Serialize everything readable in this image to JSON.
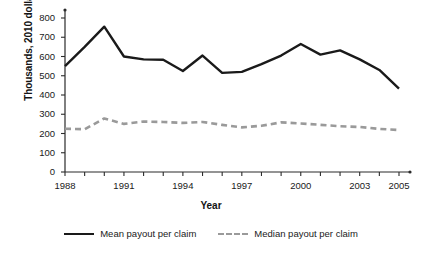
{
  "chart_data": {
    "type": "line",
    "title": "",
    "xlabel": "Year",
    "ylabel": "Thousands, 2010 dollars",
    "xlim": [
      1988,
      2005.4
    ],
    "ylim": [
      0,
      840
    ],
    "grid": false,
    "legend_position": "bottom",
    "x": [
      1988,
      1989,
      1990,
      1991,
      1992,
      1993,
      1994,
      1995,
      1996,
      1997,
      1998,
      1999,
      2000,
      2001,
      2002,
      2003,
      2004,
      2005
    ],
    "xticks": [
      1988,
      1991,
      1994,
      1997,
      2000,
      2003,
      2005
    ],
    "xtick_labels": [
      "1988",
      "1991",
      "1994",
      "1997",
      "2000",
      "2003",
      "2005"
    ],
    "yticks": [
      0,
      100,
      200,
      300,
      400,
      500,
      600,
      700,
      800
    ],
    "ytick_labels": [
      "0",
      "100",
      "200",
      "300",
      "400",
      "500",
      "600",
      "700",
      "800"
    ],
    "series": [
      {
        "name": "Mean payout per claim",
        "style": "solid",
        "color": "#1a1a1a",
        "values": [
          550,
          650,
          755,
          600,
          585,
          583,
          525,
          605,
          515,
          520,
          560,
          605,
          665,
          610,
          632,
          585,
          530,
          433
        ]
      },
      {
        "name": "Median payout per claim",
        "style": "dashed",
        "color": "#9a9a9a",
        "values": [
          225,
          222,
          278,
          250,
          262,
          260,
          255,
          260,
          245,
          232,
          240,
          258,
          252,
          245,
          238,
          234,
          224,
          218
        ]
      }
    ]
  },
  "legend": {
    "entries": [
      {
        "label": "Mean payout per claim"
      },
      {
        "label": "Median payout per claim"
      }
    ]
  },
  "axes": {
    "y_title": "Thousands, 2010 dollars",
    "x_title": "Year"
  }
}
